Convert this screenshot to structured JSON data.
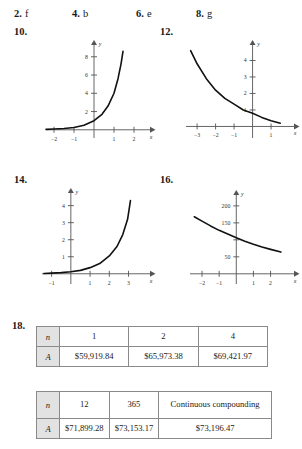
{
  "answers": [
    {
      "num": "2.",
      "val": "f"
    },
    {
      "num": "4.",
      "val": "b"
    },
    {
      "num": "6.",
      "val": "e"
    },
    {
      "num": "8.",
      "val": "g"
    }
  ],
  "exercise_labels": {
    "g10": "10.",
    "g12": "12.",
    "g14": "14.",
    "g16": "16.",
    "t18": "18."
  },
  "axis_titles": {
    "x": "x",
    "y": "y"
  },
  "chart_data": [
    {
      "id": "graph-10",
      "label": "10.",
      "type": "line",
      "title": "",
      "xlabel": "x",
      "ylabel": "y",
      "xlim": [
        -2.4,
        2.4
      ],
      "ylim": [
        -0.9,
        9.4
      ],
      "xticks": [
        -2,
        -1,
        1,
        2
      ],
      "xtick_labels": [
        "-2",
        "-1",
        "1",
        "2"
      ],
      "yticks": [
        2,
        4,
        6,
        8
      ],
      "ytick_labels": [
        "2",
        "4",
        "6",
        "8"
      ],
      "grid": false,
      "legend": "none",
      "description": "increasing exponential growth curve",
      "points": [
        {
          "x": -2.4,
          "y": 0.05
        },
        {
          "x": -2.0,
          "y": 0.08
        },
        {
          "x": -1.5,
          "y": 0.14
        },
        {
          "x": -1.0,
          "y": 0.25
        },
        {
          "x": -0.5,
          "y": 0.5
        },
        {
          "x": 0.0,
          "y": 1.0
        },
        {
          "x": 0.4,
          "y": 1.7
        },
        {
          "x": 0.7,
          "y": 2.6
        },
        {
          "x": 1.0,
          "y": 4.0
        },
        {
          "x": 1.2,
          "y": 5.6
        },
        {
          "x": 1.35,
          "y": 7.2
        },
        {
          "x": 1.45,
          "y": 8.6
        }
      ]
    },
    {
      "id": "graph-12",
      "label": "12.",
      "type": "line",
      "title": "",
      "xlabel": "x",
      "ylabel": "y",
      "xlim": [
        -3.6,
        1.7
      ],
      "ylim": [
        -0.7,
        5.0
      ],
      "xticks": [
        -3,
        -2,
        -1,
        1
      ],
      "xtick_labels": [
        "-3",
        "-2",
        "-1",
        "1"
      ],
      "yticks": [
        1,
        2,
        3,
        4
      ],
      "ytick_labels": [
        "1",
        "2",
        "3",
        "4"
      ],
      "grid": false,
      "legend": "none",
      "description": "decreasing exponential decay curve",
      "points": [
        {
          "x": -3.35,
          "y": 4.6
        },
        {
          "x": -3.0,
          "y": 3.8
        },
        {
          "x": -2.5,
          "y": 2.9
        },
        {
          "x": -2.0,
          "y": 2.2
        },
        {
          "x": -1.5,
          "y": 1.7
        },
        {
          "x": -1.0,
          "y": 1.35
        },
        {
          "x": -0.5,
          "y": 1.0
        },
        {
          "x": 0.0,
          "y": 0.8
        },
        {
          "x": 0.5,
          "y": 0.55
        },
        {
          "x": 1.0,
          "y": 0.35
        },
        {
          "x": 1.5,
          "y": 0.2
        }
      ]
    },
    {
      "id": "graph-14",
      "label": "14.",
      "type": "line",
      "title": "",
      "xlabel": "x",
      "ylabel": "y",
      "xlim": [
        -1.5,
        3.7
      ],
      "ylim": [
        -0.6,
        4.8
      ],
      "xticks": [
        -1,
        1,
        2,
        3
      ],
      "xtick_labels": [
        "-1",
        "1",
        "2",
        "3"
      ],
      "yticks": [
        1,
        2,
        3,
        4
      ],
      "ytick_labels": [
        "1",
        "2",
        "3",
        "4"
      ],
      "grid": false,
      "legend": "none",
      "description": "increasing exponential growth curve",
      "points": [
        {
          "x": -1.4,
          "y": 0.02
        },
        {
          "x": -1.0,
          "y": 0.04
        },
        {
          "x": -0.5,
          "y": 0.07
        },
        {
          "x": 0.0,
          "y": 0.12
        },
        {
          "x": 0.5,
          "y": 0.2
        },
        {
          "x": 1.0,
          "y": 0.36
        },
        {
          "x": 1.5,
          "y": 0.6
        },
        {
          "x": 2.0,
          "y": 1.05
        },
        {
          "x": 2.4,
          "y": 1.6
        },
        {
          "x": 2.7,
          "y": 2.3
        },
        {
          "x": 2.95,
          "y": 3.2
        },
        {
          "x": 3.1,
          "y": 4.3
        }
      ]
    },
    {
      "id": "graph-16",
      "label": "16.",
      "type": "line",
      "title": "",
      "xlabel": "x",
      "ylabel": "y",
      "xlim": [
        -2.7,
        2.9
      ],
      "ylim": [
        -30,
        235
      ],
      "xticks": [
        -2,
        -1,
        1,
        2
      ],
      "xtick_labels": [
        "-2",
        "-1",
        "1",
        "2"
      ],
      "yticks": [
        50,
        100,
        150,
        200
      ],
      "ytick_labels": [
        "50",
        "",
        "150",
        "200"
      ],
      "grid": false,
      "legend": "none",
      "description": "gently decreasing decay curve",
      "points": [
        {
          "x": -2.45,
          "y": 168
        },
        {
          "x": -2.0,
          "y": 155
        },
        {
          "x": -1.5,
          "y": 141
        },
        {
          "x": -1.0,
          "y": 128
        },
        {
          "x": -0.5,
          "y": 117
        },
        {
          "x": 0.0,
          "y": 106
        },
        {
          "x": 0.5,
          "y": 96
        },
        {
          "x": 1.0,
          "y": 87
        },
        {
          "x": 1.5,
          "y": 79
        },
        {
          "x": 2.0,
          "y": 72
        },
        {
          "x": 2.6,
          "y": 64
        }
      ]
    }
  ],
  "tables": [
    {
      "id": "table-18-a",
      "rows": [
        {
          "header": "n",
          "cells": [
            "1",
            "2",
            "4"
          ]
        },
        {
          "header": "A",
          "cells": [
            "$59,919.84",
            "$65,973.38",
            "$69,421.97"
          ]
        }
      ]
    },
    {
      "id": "table-18-b",
      "rows": [
        {
          "header": "n",
          "cells": [
            "12",
            "365",
            "Continuous compounding"
          ]
        },
        {
          "header": "A",
          "cells": [
            "$71,899.28",
            "$73,153.17",
            "$73,196.47"
          ]
        }
      ]
    }
  ]
}
